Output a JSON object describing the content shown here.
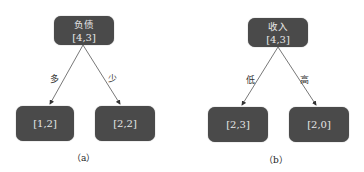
{
  "diagrams": [
    {
      "caption": "（a）",
      "root": {
        "title": "负债",
        "value": "[4,3]"
      },
      "children": [
        {
          "edge_label": "多",
          "value": "[1,2]"
        },
        {
          "edge_label": "少",
          "value": "[2,2]"
        }
      ]
    },
    {
      "caption": "（b）",
      "root": {
        "title": "收入",
        "value": "[4,3]"
      },
      "children": [
        {
          "edge_label": "低",
          "value": "[2,3]"
        },
        {
          "edge_label": "高",
          "value": "[2,0]"
        }
      ]
    }
  ],
  "colors": {
    "node_fill": "#4a4a4a",
    "node_text": "#e6e6e6",
    "edge": "#555555"
  }
}
